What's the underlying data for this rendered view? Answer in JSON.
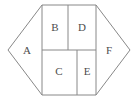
{
  "figure": {
    "type": "geometric-partition-diagram",
    "shape": "hexagon",
    "background_color": "#ffffff",
    "stroke_color": "#888888",
    "label_color": "#4d4d4d",
    "canvas": {
      "width": 138,
      "height": 101
    }
  },
  "hexagon": {
    "vertices": [
      {
        "x": 8,
        "y": 50
      },
      {
        "x": 42,
        "y": 5
      },
      {
        "x": 96,
        "y": 5
      },
      {
        "x": 130,
        "y": 50
      },
      {
        "x": 96,
        "y": 95
      },
      {
        "x": 42,
        "y": 95
      }
    ],
    "points_attr": "8,50 42,5 96,5 130,50 96,95 42,95"
  },
  "dividers": {
    "left_vertical": {
      "x1": 42,
      "y1": 5,
      "x2": 42,
      "y2": 95
    },
    "right_vertical": {
      "x1": 96,
      "y1": 5,
      "x2": 96,
      "y2": 95
    },
    "horizontal": {
      "x1": 42,
      "y1": 50,
      "x2": 96,
      "y2": 50
    },
    "top_row_split": {
      "x1": 68,
      "y1": 5,
      "x2": 68,
      "y2": 50
    },
    "bottom_row_split": {
      "x1": 77,
      "y1": 50,
      "x2": 77,
      "y2": 95
    }
  },
  "regions": [
    {
      "id": "A",
      "label": "A",
      "kind": "triangle",
      "position": "left",
      "label_x": 27,
      "label_y": 51,
      "points_attr": "8,50 42,5 42,95"
    },
    {
      "id": "B",
      "label": "B",
      "kind": "rectangle",
      "position": "top-left",
      "label_x": 55,
      "label_y": 28,
      "x": 42,
      "y": 5,
      "width": 26,
      "height": 45
    },
    {
      "id": "D",
      "label": "D",
      "kind": "rectangle",
      "position": "top-right",
      "label_x": 82,
      "label_y": 28,
      "x": 68,
      "y": 5,
      "width": 28,
      "height": 45
    },
    {
      "id": "C",
      "label": "C",
      "kind": "rectangle",
      "position": "bottom-left",
      "label_x": 59,
      "label_y": 72,
      "x": 42,
      "y": 50,
      "width": 35,
      "height": 45
    },
    {
      "id": "E",
      "label": "E",
      "kind": "rectangle",
      "position": "bottom-right",
      "label_x": 87,
      "label_y": 72,
      "x": 77,
      "y": 50,
      "width": 19,
      "height": 45
    },
    {
      "id": "F",
      "label": "F",
      "kind": "triangle",
      "position": "right",
      "label_x": 109,
      "label_y": 51,
      "points_attr": "96,5 130,50 96,95"
    }
  ]
}
